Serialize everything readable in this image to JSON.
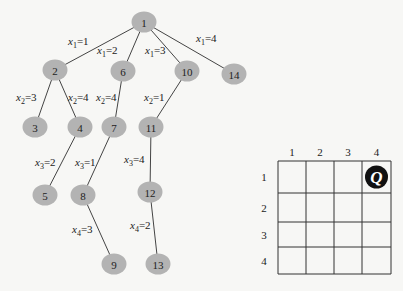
{
  "tree": {
    "nodes": [
      {
        "id": "1",
        "x": 144,
        "y": 22
      },
      {
        "id": "2",
        "x": 55,
        "y": 70
      },
      {
        "id": "6",
        "x": 123,
        "y": 71
      },
      {
        "id": "10",
        "x": 187,
        "y": 71
      },
      {
        "id": "14",
        "x": 234,
        "y": 74
      },
      {
        "id": "3",
        "x": 35,
        "y": 127
      },
      {
        "id": "4",
        "x": 80,
        "y": 127
      },
      {
        "id": "7",
        "x": 114,
        "y": 127
      },
      {
        "id": "11",
        "x": 151,
        "y": 127
      },
      {
        "id": "5",
        "x": 45,
        "y": 195
      },
      {
        "id": "8",
        "x": 83,
        "y": 195
      },
      {
        "id": "12",
        "x": 150,
        "y": 192
      },
      {
        "id": "9",
        "x": 114,
        "y": 264
      },
      {
        "id": "13",
        "x": 158,
        "y": 264
      }
    ],
    "edges": [
      {
        "from": "1",
        "to": "2",
        "var": "x",
        "sub": "1",
        "val": "1",
        "lx": 68,
        "ly": 45
      },
      {
        "from": "1",
        "to": "6",
        "var": "x",
        "sub": "1",
        "val": "2",
        "lx": 97,
        "ly": 54
      },
      {
        "from": "1",
        "to": "10",
        "var": "x",
        "sub": "1",
        "val": "3",
        "lx": 145,
        "ly": 54
      },
      {
        "from": "1",
        "to": "14",
        "var": "x",
        "sub": "1",
        "val": "4",
        "lx": 196,
        "ly": 42
      },
      {
        "from": "2",
        "to": "3",
        "var": "x",
        "sub": "2",
        "val": "3",
        "lx": 16,
        "ly": 101
      },
      {
        "from": "2",
        "to": "4",
        "var": "x",
        "sub": "2",
        "val": "4",
        "lx": 68,
        "ly": 101
      },
      {
        "from": "6",
        "to": "7",
        "var": "x",
        "sub": "2",
        "val": "4",
        "lx": 96,
        "ly": 101
      },
      {
        "from": "10",
        "to": "11",
        "var": "x",
        "sub": "2",
        "val": "1",
        "lx": 144,
        "ly": 101
      },
      {
        "from": "4",
        "to": "5",
        "var": "x",
        "sub": "3",
        "val": "2",
        "lx": 35,
        "ly": 166
      },
      {
        "from": "7",
        "to": "8",
        "var": "x",
        "sub": "3",
        "val": "1",
        "lx": 75,
        "ly": 166
      },
      {
        "from": "11",
        "to": "12",
        "var": "x",
        "sub": "3",
        "val": "4",
        "lx": 124,
        "ly": 163
      },
      {
        "from": "8",
        "to": "9",
        "var": "x",
        "sub": "4",
        "val": "3",
        "lx": 72,
        "ly": 233
      },
      {
        "from": "12",
        "to": "13",
        "var": "x",
        "sub": "4",
        "val": "2",
        "lx": 130,
        "ly": 229
      }
    ]
  },
  "board": {
    "col_labels": [
      "1",
      "2",
      "3",
      "4"
    ],
    "row_labels": [
      "1",
      "2",
      "3",
      "4"
    ],
    "queen": {
      "row": 1,
      "col": 4,
      "glyph": "Q",
      "icon": "queen-icon"
    }
  }
}
